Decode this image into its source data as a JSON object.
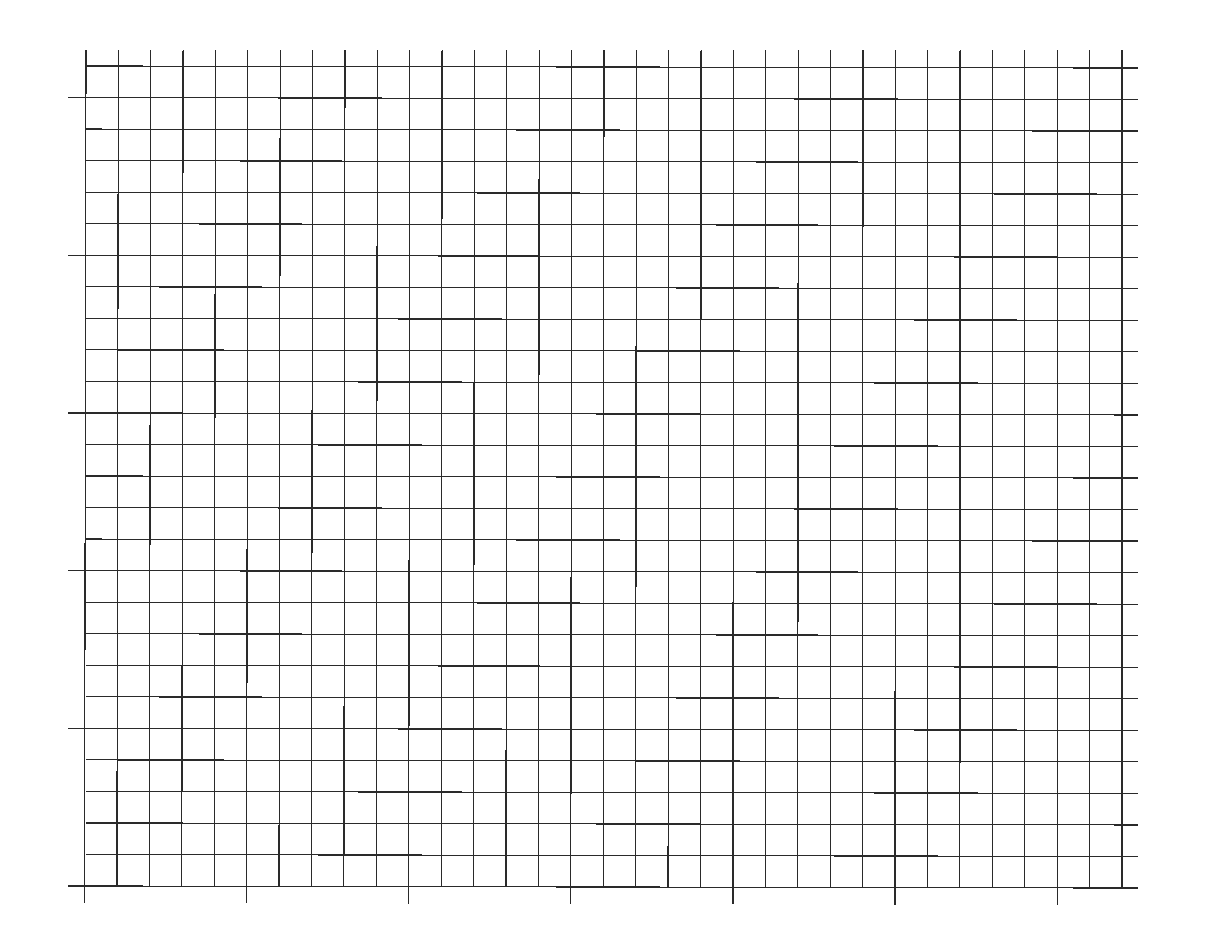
{
  "page": {
    "type": "blank graph paper",
    "background": "#ffffff",
    "line_color": "#2a2a2a"
  },
  "grid": {
    "columns": 32,
    "rows": 26,
    "x_start": 86,
    "x_end": 1122,
    "y_start": 66,
    "y_end": 886,
    "vertical_line_top": 50,
    "horizontal_line_right": 1138,
    "major_every": 5,
    "left_tick_x": 68,
    "bottom_tick_y": 903,
    "left_major_row_offset": 1,
    "bottom_major_col_offset": 0,
    "skew_y": 2
  }
}
